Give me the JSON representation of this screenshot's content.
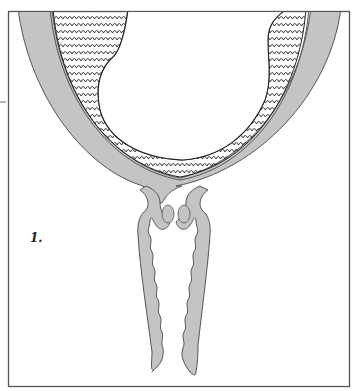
{
  "figure": {
    "label": "1.",
    "colors": {
      "background": "#ffffff",
      "frame": "#555555",
      "wall_fill": "#c4c4c4",
      "wall_stroke": "#555555",
      "hatch_stroke": "#222222",
      "cavity": "#ffffff"
    }
  }
}
